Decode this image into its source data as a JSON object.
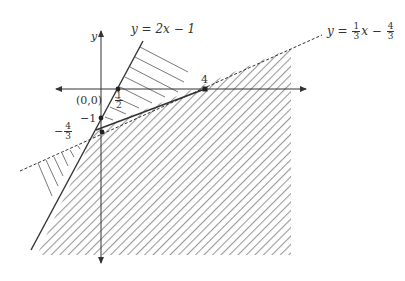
{
  "diagram": {
    "axes": {
      "x_label": "",
      "y_label": "y"
    },
    "lines": [
      {
        "id": "solid",
        "equation_lhs": "y = ",
        "equation_rhs": "2x − 1",
        "style": "solid"
      },
      {
        "id": "dashed",
        "equation_lhs": "y = ",
        "frac1_num": "1",
        "frac1_den": "3",
        "mid": "x − ",
        "frac2_num": "4",
        "frac2_den": "3",
        "style": "dashed"
      }
    ],
    "point_labels": {
      "origin": "(0,0)",
      "y_intercept_solid": "−1",
      "y_intercept_dashed_sign": "−",
      "y_intercept_dashed_num": "4",
      "y_intercept_dashed_den": "3",
      "x_intercept_solid_num": "1",
      "x_intercept_solid_den": "2",
      "x_intercept_dashed": "4"
    },
    "colors": {
      "line": "#333333",
      "hatch": "#9a9a9a",
      "thin_hatch": "#555555"
    }
  }
}
